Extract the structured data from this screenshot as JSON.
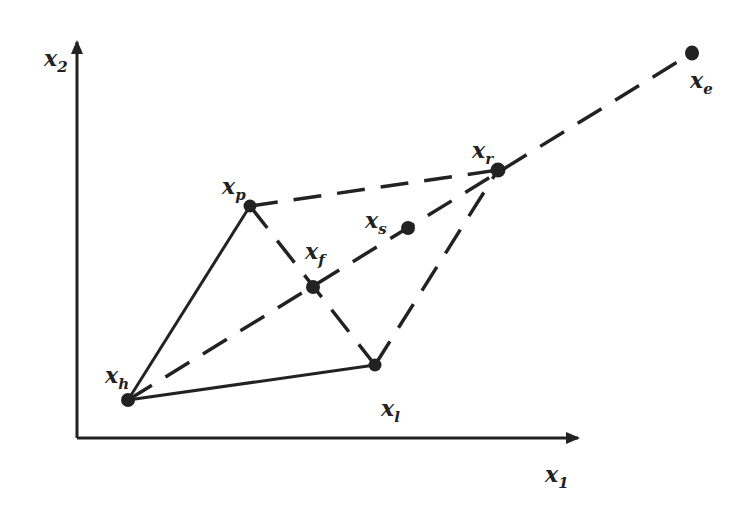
{
  "diagram": {
    "title": "",
    "colors": {
      "ink": "#222222",
      "background": "#ffffff"
    },
    "axes": {
      "x": {
        "label": "x",
        "subscript": "1"
      },
      "y": {
        "label": "x",
        "subscript": "2"
      }
    },
    "points": [
      {
        "id": "h",
        "label": "x",
        "subscript": "h"
      },
      {
        "id": "p",
        "label": "x",
        "subscript": "p"
      },
      {
        "id": "l",
        "label": "x",
        "subscript": "l"
      },
      {
        "id": "f",
        "label": "x",
        "subscript": "f"
      },
      {
        "id": "s",
        "label": "x",
        "subscript": "s"
      },
      {
        "id": "r",
        "label": "x",
        "subscript": "r"
      },
      {
        "id": "e",
        "label": "x",
        "subscript": "e"
      }
    ],
    "edges": [
      {
        "from": "h",
        "to": "p",
        "style": "solid"
      },
      {
        "from": "h",
        "to": "l",
        "style": "solid"
      },
      {
        "from": "p",
        "to": "l",
        "style": "dashed"
      },
      {
        "from": "p",
        "to": "r",
        "style": "dashed"
      },
      {
        "from": "l",
        "to": "r",
        "style": "dashed"
      },
      {
        "from": "h",
        "to": "e",
        "style": "dashed"
      }
    ]
  }
}
